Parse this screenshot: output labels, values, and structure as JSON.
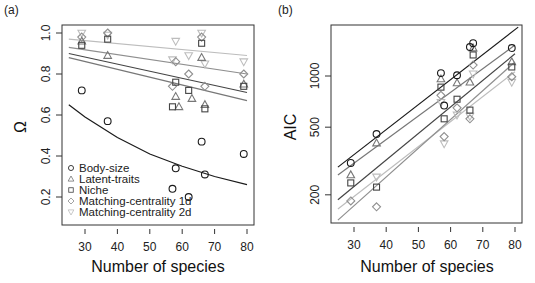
{
  "chart_data": [
    {
      "panel": "(a)",
      "type": "scatter",
      "xlabel": "Number of species",
      "ylabel": "Ω",
      "xlim": [
        24,
        82
      ],
      "ylim": [
        0.06,
        1.04
      ],
      "x_ticks": [
        30,
        40,
        50,
        60,
        70,
        80
      ],
      "y_ticks": [
        0.2,
        0.4,
        0.6,
        0.8,
        1.0
      ],
      "y_tick_labels": [
        "0.2",
        "0.4",
        "0.6",
        "0.8",
        "1.0"
      ],
      "y_scale": "linear",
      "grid": false,
      "legend": {
        "position": "bottom-left",
        "entries": [
          {
            "label": "Body-size",
            "marker": "circle",
            "color": "#1a1a1a"
          },
          {
            "label": "Latent-traits",
            "marker": "triangle-up",
            "color": "#777777"
          },
          {
            "label": "Niche",
            "marker": "square",
            "color": "#444444"
          },
          {
            "label": "Matching-centrality 1d",
            "marker": "diamond",
            "color": "#8f8f8f"
          },
          {
            "label": "Matching-centrality 2d",
            "marker": "triangle-down",
            "color": "#bdbdbd"
          }
        ]
      },
      "series": [
        {
          "name": "Body-size",
          "marker": "circle",
          "color": "#1a1a1a",
          "x": [
            29,
            37,
            57,
            58,
            62,
            66,
            67,
            79
          ],
          "y": [
            0.72,
            0.57,
            0.24,
            0.34,
            0.2,
            0.47,
            0.31,
            0.41
          ],
          "fit": {
            "x": [
              25,
              30,
              40,
              50,
              60,
              70,
              80
            ],
            "y": [
              0.65,
              0.59,
              0.49,
              0.41,
              0.35,
              0.3,
              0.26
            ]
          }
        },
        {
          "name": "Latent-traits",
          "marker": "triangle-up",
          "color": "#777777",
          "x": [
            29,
            37,
            58,
            59,
            63,
            66,
            67,
            79
          ],
          "y": [
            0.96,
            0.89,
            0.69,
            0.64,
            0.68,
            0.88,
            0.65,
            0.75
          ],
          "fit": {
            "x": [
              25,
              80
            ],
            "y": [
              0.88,
              0.67
            ]
          }
        },
        {
          "name": "Niche",
          "marker": "square",
          "color": "#444444",
          "x": [
            29,
            37,
            57,
            58,
            62,
            66,
            67,
            79
          ],
          "y": [
            0.94,
            0.97,
            0.64,
            0.76,
            0.72,
            0.95,
            0.63,
            0.74
          ],
          "fit": {
            "x": [
              25,
              80
            ],
            "y": [
              0.9,
              0.71
            ]
          }
        },
        {
          "name": "Matching-centrality 1d",
          "marker": "diamond",
          "color": "#8f8f8f",
          "x": [
            29,
            37,
            57,
            58,
            62,
            66,
            67,
            79
          ],
          "y": [
            0.98,
            1.0,
            0.74,
            0.86,
            0.8,
            0.98,
            0.74,
            0.8
          ],
          "fit": {
            "x": [
              25,
              80
            ],
            "y": [
              0.93,
              0.8
            ]
          }
        },
        {
          "name": "Matching-centrality 2d",
          "marker": "triangle-down",
          "color": "#bdbdbd",
          "x": [
            29,
            37,
            57,
            58,
            62,
            66,
            67,
            79
          ],
          "y": [
            1.0,
            0.99,
            0.87,
            0.96,
            0.89,
            1.0,
            0.85,
            0.86
          ],
          "fit": {
            "x": [
              25,
              80
            ],
            "y": [
              0.97,
              0.89
            ]
          }
        }
      ]
    },
    {
      "panel": "(b)",
      "type": "scatter",
      "xlabel": "Number of species",
      "ylabel": "AIC",
      "xlim": [
        24,
        82
      ],
      "ylim": [
        125,
        2000
      ],
      "x_ticks": [
        30,
        40,
        50,
        60,
        70,
        80
      ],
      "y_ticks": [
        200,
        500,
        1000
      ],
      "y_tick_labels": [
        "200",
        "500",
        "1000"
      ],
      "y_scale": "log",
      "grid": false,
      "series": [
        {
          "name": "Body-size",
          "marker": "circle",
          "color": "#1a1a1a",
          "x": [
            29,
            37,
            57,
            58,
            62,
            66,
            67,
            79
          ],
          "y": [
            308,
            456,
            1040,
            670,
            1010,
            1480,
            1560,
            1460
          ],
          "fit": {
            "x": [
              25,
              81
            ],
            "y": [
              291,
              1940
            ]
          }
        },
        {
          "name": "Latent-traits",
          "marker": "triangle-up",
          "color": "#777777",
          "x": [
            29,
            37,
            57,
            62,
            66,
            67,
            79
          ],
          "y": [
            262,
            403,
            960,
            910,
            920,
            1460,
            1210
          ],
          "fit": {
            "x": [
              25,
              80
            ],
            "y": [
              262,
              1520
            ]
          }
        },
        {
          "name": "Niche",
          "marker": "square",
          "color": "#444444",
          "x": [
            29,
            37,
            57,
            58,
            62,
            66,
            67,
            79
          ],
          "y": [
            235,
            222,
            860,
            560,
            730,
            630,
            1330,
            1130
          ],
          "fit": {
            "x": [
              25,
              80
            ],
            "y": [
              187,
              1350
            ]
          }
        },
        {
          "name": "Matching-centrality 1d",
          "marker": "diamond",
          "color": "#8f8f8f",
          "x": [
            29,
            37,
            57,
            58,
            62,
            66,
            67,
            79
          ],
          "y": [
            184,
            170,
            770,
            440,
            650,
            560,
            1160,
            990
          ],
          "fit": {
            "x": [
              25,
              80
            ],
            "y": [
              142,
              1210
            ]
          }
        },
        {
          "name": "Matching-centrality 2d",
          "marker": "triangle-down",
          "color": "#bdbdbd",
          "x": [
            37,
            57,
            58,
            62,
            66,
            67,
            79
          ],
          "y": [
            255,
            700,
            400,
            590,
            580,
            1030,
            920
          ],
          "fit": {
            "x": [
              25,
              80
            ],
            "y": [
              165,
              1060
            ]
          }
        }
      ]
    }
  ]
}
